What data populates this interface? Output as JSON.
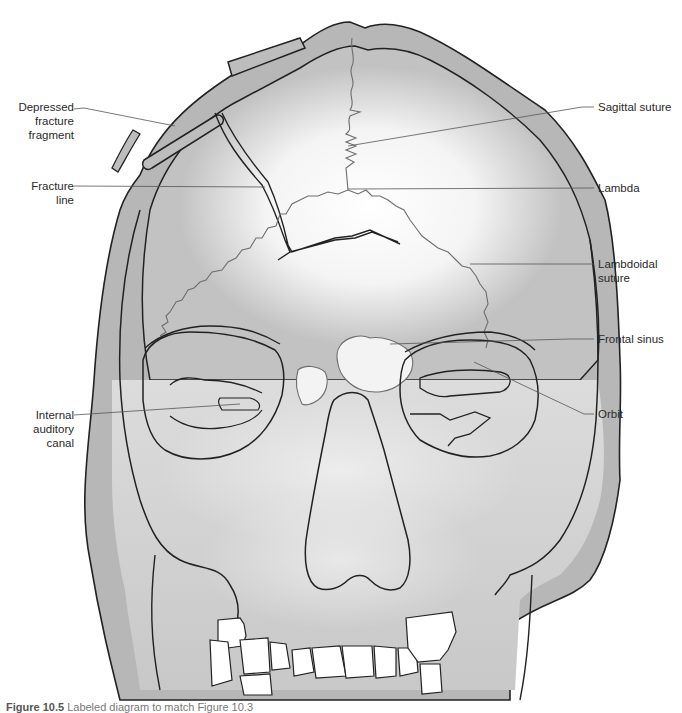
{
  "figure": {
    "colors": {
      "background": "#ffffff",
      "bone_fill": "#b9b9b9",
      "bone_fill_light": "#d4d4d4",
      "highlight": "#f4f4f4",
      "outline": "#222222",
      "suture": "#6e6e6e",
      "leader_line": "#555555",
      "label_text": "#2a2a2a"
    }
  },
  "labels": {
    "left": [
      {
        "id": "depressed-fracture-fragment",
        "text": "Depressed\nfracture\nfragment"
      },
      {
        "id": "fracture-line",
        "text": "Fracture\nline"
      },
      {
        "id": "internal-auditory-canal",
        "text": "Internal\nauditory\ncanal"
      }
    ],
    "right": [
      {
        "id": "sagittal-suture",
        "text": "Sagittal suture"
      },
      {
        "id": "lambda",
        "text": "Lambda"
      },
      {
        "id": "lambdoidal-suture",
        "text": "Lambdoidal\nsuture"
      },
      {
        "id": "frontal-sinus",
        "text": "Frontal sinus"
      },
      {
        "id": "orbit",
        "text": "Orbit"
      }
    ]
  },
  "caption": {
    "prefix": "Figure 10.5",
    "text": "Labeled diagram to match Figure 10.3"
  }
}
